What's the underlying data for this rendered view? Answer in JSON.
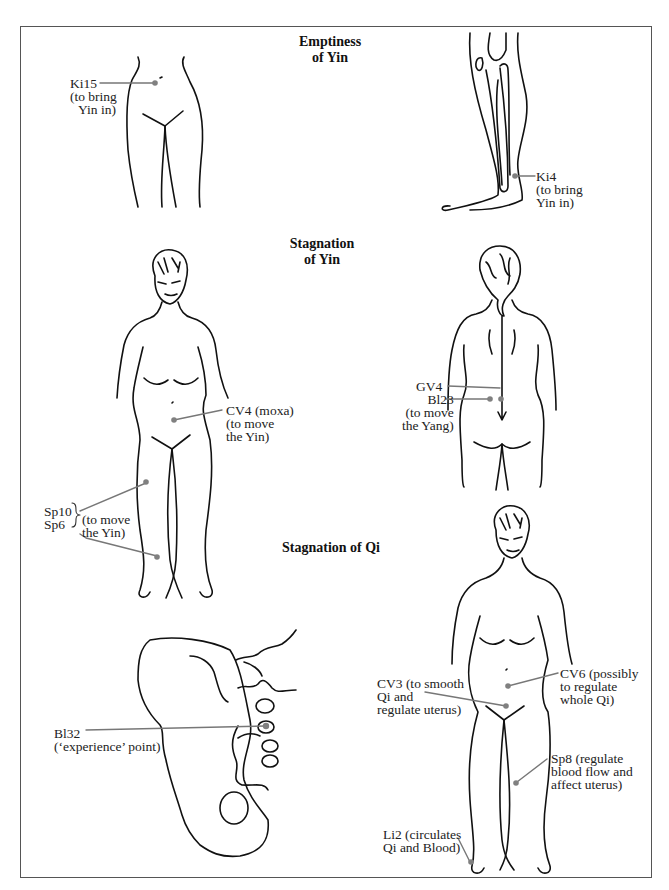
{
  "sections": {
    "emptiness_yin": {
      "title_line1": "Emptiness",
      "title_line2": "of Yin"
    },
    "stagnation_yin": {
      "title_line1": "Stagnation",
      "title_line2": "of Yin"
    },
    "stagnation_qi": {
      "title": "Stagnation of Qi"
    }
  },
  "points": {
    "ki15": {
      "code": "Ki15",
      "line2": "(to bring",
      "line3": "Yin in)"
    },
    "ki4": {
      "code": "Ki4",
      "line2": "(to bring",
      "line3": "Yin in)"
    },
    "cv4": {
      "line1": "CV4 (moxa)",
      "line2": "(to move",
      "line3": "the Yin)"
    },
    "sp10": {
      "code": "Sp10"
    },
    "sp6": {
      "code": "Sp6"
    },
    "sp10_sp6_note": {
      "line1": "(to move",
      "line2": "the Yin)"
    },
    "gv4": {
      "code": "GV4"
    },
    "bl23": {
      "code": "Bl23",
      "line2": "(to move",
      "line3": "the Yang)"
    },
    "bl32": {
      "code": "Bl32",
      "line2": "(‘experience’ point)"
    },
    "cv3": {
      "line1": "CV3 (to smooth",
      "line2": "Qi and",
      "line3": "regulate uterus)"
    },
    "cv6": {
      "line1": "CV6 (possibly",
      "line2": "to regulate",
      "line3": "whole Qi)"
    },
    "sp8": {
      "line1": "Sp8 (regulate",
      "line2": "blood flow and",
      "line3": "affect uterus)"
    },
    "li2": {
      "line1": "Li2 (circulates",
      "line2": "Qi and Blood)"
    }
  },
  "colors": {
    "line": "#111111",
    "pointer": "#777777",
    "point": "#808080",
    "border": "#555555"
  }
}
